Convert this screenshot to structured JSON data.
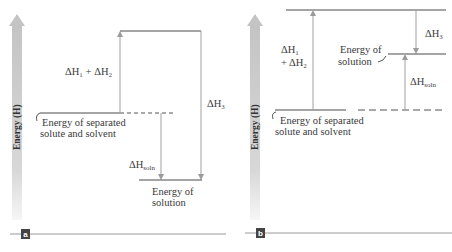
{
  "colors": {
    "level_line": "#4a4a4a",
    "arrow": "#a0a0a0",
    "energy_bar_top": "#c8c8c8",
    "energy_bar_bottom": "#f4f4f4",
    "badge": "#444444",
    "rule": "#9a9a9a"
  },
  "panels": [
    {
      "id": "a",
      "badge": "a",
      "axis_label": "Energy (H)",
      "labels": {
        "dh12": "ΔH₁ + ΔH₂",
        "dh3": "ΔH₃",
        "dhsoln": "ΔH",
        "dhsoln_sub": "soln",
        "separated_line1": "Energy of separated",
        "separated_line2": "solute and solvent",
        "solution_line1": "Energy of",
        "solution_line2": "solution"
      }
    },
    {
      "id": "b",
      "badge": "b",
      "axis_label": "Energy (H)",
      "labels": {
        "dh1": "ΔH₁",
        "dh2": "+ ΔH₂",
        "dh3": "ΔH₃",
        "dhsoln": "ΔH",
        "dhsoln_sub": "soln",
        "separated_line1": "Energy of separated",
        "separated_line2": "solute and solvent",
        "solution_line1": "Energy of",
        "solution_line2": "solution"
      }
    }
  ]
}
